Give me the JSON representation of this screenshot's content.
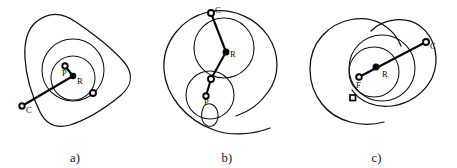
{
  "figure": {
    "background_color": "#ffffff",
    "line_color": "#0d0d0d",
    "width": 457,
    "height": 168
  },
  "panels": [
    {
      "id": "a",
      "caption": "a)",
      "curve_type": "hypotrochoid-rounded-triangle",
      "labels": {
        "center_upper": "P",
        "center_lower": "R",
        "outer_point": "C"
      },
      "markers": [
        {
          "name": "point-p",
          "label": "P",
          "style": "open-circle"
        },
        {
          "name": "point-r",
          "label": "R",
          "style": "filled-circle"
        },
        {
          "name": "point-c",
          "label": "C",
          "style": "open-circle"
        },
        {
          "name": "tracing-point",
          "label": "",
          "style": "open-circle"
        }
      ]
    },
    {
      "id": "b",
      "caption": "b)",
      "curve_type": "epitrochoid-with-loop",
      "labels": {
        "upper_point": "C",
        "mid_point": "R",
        "lower_point": "P"
      },
      "markers": [
        {
          "name": "point-c",
          "label": "C",
          "style": "open-circle"
        },
        {
          "name": "point-r",
          "label": "R",
          "style": "filled-circle"
        },
        {
          "name": "point-p",
          "label": "P",
          "style": "open-circle"
        },
        {
          "name": "junction-point",
          "label": "",
          "style": "open-circle"
        }
      ]
    },
    {
      "id": "c",
      "caption": "c)",
      "curve_type": "epitrochoid-spiral",
      "labels": {
        "outer_point": "C",
        "center_right": "R",
        "center_left": "F"
      },
      "markers": [
        {
          "name": "point-c",
          "label": "C",
          "style": "open-circle"
        },
        {
          "name": "point-r",
          "label": "R",
          "style": "filled-circle"
        },
        {
          "name": "point-f",
          "label": "F",
          "style": "open-circle"
        },
        {
          "name": "tracing-point",
          "label": "",
          "style": "open-square"
        }
      ]
    }
  ]
}
